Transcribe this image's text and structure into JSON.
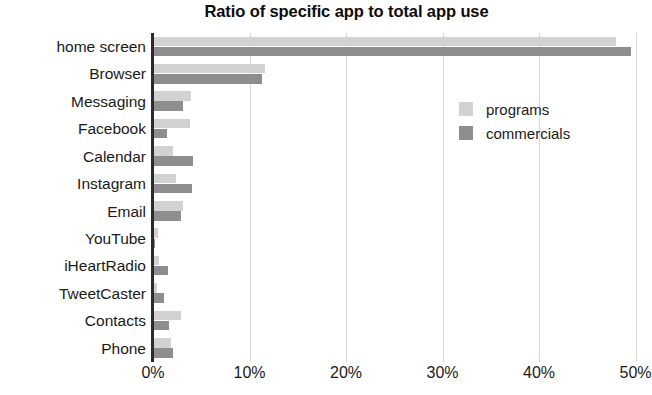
{
  "chart_data": {
    "type": "bar",
    "orientation": "horizontal",
    "title": "Ratio of specific app to total app use",
    "xlabel": "",
    "ylabel": "",
    "xlim": [
      0,
      50.15
    ],
    "xticks": [
      0,
      10,
      20,
      30,
      40,
      50
    ],
    "xtick_labels": [
      "0%",
      "10%",
      "20%",
      "30%",
      "40%",
      "50%"
    ],
    "grid": "vertical",
    "legend_position": "inside-upper-right",
    "categories": [
      "home screen",
      "Browser",
      "Messaging",
      "Facebook",
      "Calendar",
      "Instagram",
      "Email",
      "YouTube",
      "iHeartRadio",
      "TweetCaster",
      "Contacts",
      "Phone"
    ],
    "series": [
      {
        "name": "programs",
        "color": "#d2d2d2",
        "values": [
          48.0,
          11.6,
          3.9,
          3.8,
          2.1,
          2.4,
          3.1,
          0.5,
          0.6,
          0.4,
          2.9,
          1.9
        ]
      },
      {
        "name": "commercials",
        "color": "#8e8e8e",
        "values": [
          49.5,
          11.3,
          3.1,
          1.5,
          4.1,
          4.0,
          2.9,
          0.2,
          1.6,
          1.1,
          1.7,
          2.1
        ]
      }
    ],
    "value_unit": "%"
  },
  "legend": {
    "entries": [
      {
        "label": "programs",
        "color": "#d2d2d2"
      },
      {
        "label": "commercials",
        "color": "#8e8e8e"
      }
    ]
  }
}
